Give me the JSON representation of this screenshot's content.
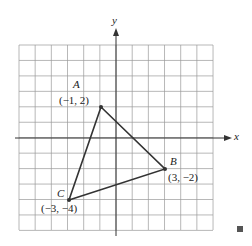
{
  "axes": {
    "x_label": "x",
    "y_label": "y",
    "range": [
      -6,
      6
    ]
  },
  "points": [
    {
      "name": "A",
      "coords": "(−1, 2)",
      "x": -1,
      "y": 2
    },
    {
      "name": "B",
      "coords": "(3, −2)",
      "x": 3,
      "y": -2
    },
    {
      "name": "C",
      "coords": "(−3, −4)",
      "x": -3,
      "y": -4
    }
  ],
  "colors": {
    "grid": "#999999",
    "triangle": "#333333"
  }
}
